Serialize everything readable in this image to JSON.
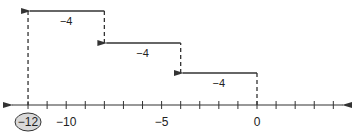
{
  "diagram": {
    "title": "",
    "number_line": {
      "min": -12,
      "max": 4,
      "tick_step": 1,
      "labels": [
        {
          "value": -12,
          "text": "−12",
          "circled": true
        },
        {
          "value": -10,
          "text": "−10",
          "circled": false
        },
        {
          "value": -5,
          "text": "−5",
          "circled": false
        },
        {
          "value": 0,
          "text": "0",
          "circled": false
        }
      ],
      "circle_fill": "#d9d9d9"
    },
    "jumps": [
      {
        "from": 0,
        "to": -4,
        "label": "−4"
      },
      {
        "from": -4,
        "to": -8,
        "label": "−4"
      },
      {
        "from": -8,
        "to": -12,
        "label": "−4"
      }
    ],
    "colors": {
      "line": "#333333",
      "text": "#222222"
    }
  }
}
